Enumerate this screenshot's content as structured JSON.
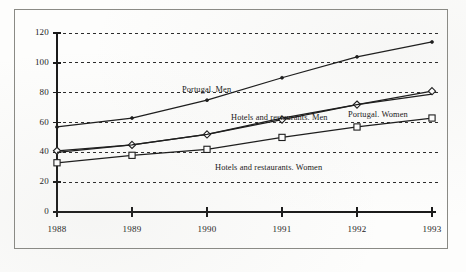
{
  "chart_data": {
    "type": "line",
    "title": "",
    "subtitle": "",
    "xlabel": "",
    "ylabel": "",
    "categories": [
      "1988",
      "1989",
      "1990",
      "1991",
      "1992",
      "1993"
    ],
    "x": [
      1988,
      1989,
      1990,
      1991,
      1992,
      1993
    ],
    "ylim": [
      0,
      120
    ],
    "xlim": [
      1988,
      1993
    ],
    "yticks": [
      0,
      20,
      40,
      60,
      80,
      100,
      120
    ],
    "ytick_labels": [
      "0",
      "20",
      "40",
      "60",
      "80",
      "100",
      "120"
    ],
    "xtick_labels": [
      "1988",
      "1989",
      "1990",
      "1991",
      "1992",
      "1993"
    ],
    "grid": true,
    "grid_style": "dashed-horizontal",
    "legend": "inline-labels",
    "series": [
      {
        "name": "Portugal. Men",
        "marker": "dot",
        "values": [
          57,
          63,
          75,
          90,
          104,
          114
        ],
        "label_text": "Portugal. Men"
      },
      {
        "name": "Portugal. Women",
        "marker": "diamond",
        "values": [
          41,
          45,
          52,
          62,
          72,
          81
        ],
        "label_text": "Portugal. Women"
      },
      {
        "name": "Hotels and restaurants. Men",
        "marker": "none",
        "values": [
          40,
          45,
          52,
          63,
          72,
          79
        ],
        "label_text": "Hotels and restaurants. Men"
      },
      {
        "name": "Hotels and restaurants. Women",
        "marker": "square",
        "values": [
          33,
          38,
          42,
          50,
          57,
          63
        ],
        "label_text": "Hotels and restaurants. Women"
      }
    ],
    "colors": {
      "line": "#1a1a1a",
      "grid": "#2b2b2b",
      "axis": "#1a1a1a",
      "text": "#161616",
      "frame": "#8a8a85",
      "background": "#fdfdfc"
    }
  }
}
